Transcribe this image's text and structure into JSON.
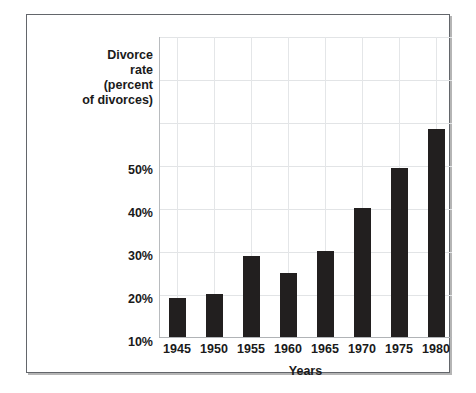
{
  "chart_data": {
    "type": "bar",
    "title": "",
    "xlabel": "Years",
    "ylabel": "Divorce\nrate\n(percent\nof divorces)",
    "categories": [
      "1945",
      "1950",
      "1955",
      "1960",
      "1965",
      "1970",
      "1975",
      "1980"
    ],
    "values": [
      9,
      10,
      19,
      15,
      20,
      30,
      39.5,
      48.5
    ],
    "ylim": [
      0,
      70
    ],
    "ytick_labels": [
      "10%",
      "20%",
      "30%",
      "40%",
      "50%"
    ],
    "ytick_values": [
      10,
      20,
      30,
      40,
      50
    ],
    "gridlines": {
      "horizontal": [
        10,
        20,
        30,
        40,
        50,
        60,
        70
      ],
      "vertical_at_categories": true,
      "grid": true
    },
    "bar_color": "#221f1f",
    "grid_color": "#e2e4e6",
    "frame_color": "#63666b",
    "legend": null
  }
}
